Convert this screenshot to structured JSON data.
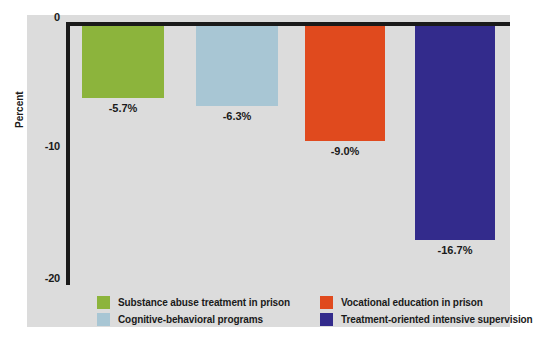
{
  "chart_data": {
    "type": "bar",
    "title": "",
    "xlabel": "",
    "ylabel": "Percent",
    "ylim": [
      -20,
      0
    ],
    "grid": false,
    "legend_position": "bottom",
    "yticks": [
      "0",
      "-10",
      "-20"
    ],
    "categories": [
      "Substance abuse treatment in prison",
      "Cognitive-behavioral programs",
      "Vocational education in prison",
      "Treatment-oriented intensive supervision"
    ],
    "values": [
      -5.7,
      -6.3,
      -9.0,
      -16.7
    ],
    "value_labels": [
      "-5.7%",
      "-6.3%",
      "-9.0%",
      "-16.7%"
    ],
    "colors": [
      "#8CB43C",
      "#A8C6D4",
      "#E04A1E",
      "#332B8C"
    ]
  },
  "axis": {
    "y_title": "Percent",
    "tick_0": "0",
    "tick_10": "-10",
    "tick_20": "-20"
  },
  "bars": [
    {
      "label": "-5.7%",
      "color": "#8CB43C"
    },
    {
      "label": "-6.3%",
      "color": "#A8C6D4"
    },
    {
      "label": "-9.0%",
      "color": "#E04A1E"
    },
    {
      "label": "-16.7%",
      "color": "#332B8C"
    }
  ],
  "legend": {
    "items": [
      {
        "label": "Substance abuse treatment in prison",
        "color": "#8CB43C"
      },
      {
        "label": "Cognitive-behavioral programs",
        "color": "#A8C6D4"
      },
      {
        "label": "Vocational education in prison",
        "color": "#E04A1E"
      },
      {
        "label": "Treatment-oriented intensive supervision",
        "color": "#332B8C"
      }
    ]
  }
}
